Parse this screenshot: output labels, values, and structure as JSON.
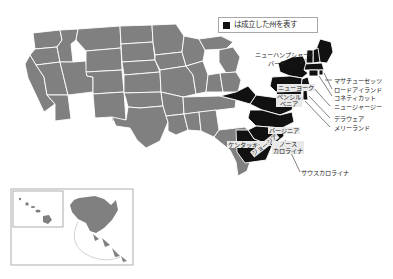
{
  "legend": {
    "swatch_color": "#111111",
    "text": "は成立した州を表す"
  },
  "colors": {
    "established_state": "#111111",
    "other_state": "#808080",
    "border": "#ffffff",
    "background": "#ffffff",
    "label_box": "#e9e9e9",
    "leader_line": "#2b2b2b",
    "inset_frame": "#9a9a9a"
  },
  "map": {
    "title_alt": "アメリカ合衆国地図",
    "inset_alaska_label": "アラスカ",
    "inset_hawaii_label": "ハワイ"
  },
  "labels": {
    "new_hampshire": "ニューハンプシャー",
    "vermont": "バーモント",
    "massachusetts": "マサチューセッツ",
    "rhode_island": "ロードアイランド",
    "connecticut": "コネティカット",
    "new_jersey": "ニュージャージー",
    "delaware": "デラウェア",
    "maryland": "メリーランド",
    "new_york": "ニューヨーク",
    "pennsylvania_line1": "ペンシル",
    "pennsylvania_line2": "ベニア",
    "virginia": "バージニア",
    "kentucky": "ケンタッキー",
    "north_carolina_line1": "ノース",
    "north_carolina_line2": "カロライナ",
    "south_carolina": "サウスカロライナ",
    "georgia": "ジョージア"
  }
}
